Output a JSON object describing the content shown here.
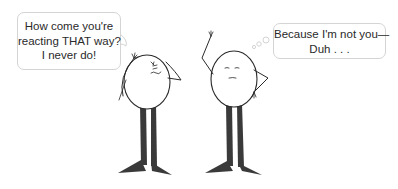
{
  "left_bubble": {
    "type": "speech",
    "lines": [
      "How come you're",
      "reacting THAT way?",
      "I never do!"
    ]
  },
  "right_bubble": {
    "type": "thought",
    "lines": [
      "Because I'm not you—",
      "Duh . . ."
    ]
  },
  "characters": [
    {
      "name": "left-egg-figure",
      "expression": "angry",
      "pose": "scratching head"
    },
    {
      "name": "right-egg-figure",
      "expression": "indifferent",
      "pose": "hand on hip, arm raised"
    }
  ],
  "colors": {
    "ink": "#2a2a2a",
    "leg": "#3a3a3a",
    "bubble_border": "#d4d4d4",
    "text": "#2a2a2a"
  }
}
